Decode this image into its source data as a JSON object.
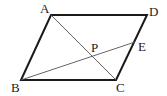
{
  "diagram": {
    "type": "geometry-parallelogram",
    "points": {
      "A": {
        "label": "A",
        "x": 51,
        "y": 15
      },
      "D": {
        "label": "D",
        "x": 147,
        "y": 15
      },
      "B": {
        "label": "B",
        "x": 21,
        "y": 80
      },
      "C": {
        "label": "C",
        "x": 116,
        "y": 80
      },
      "E": {
        "label": "E",
        "x": 135,
        "y": 42
      },
      "P": {
        "label": "P",
        "x": 91,
        "y": 56
      }
    },
    "edges": [
      {
        "from": "A",
        "to": "D",
        "style": "thick"
      },
      {
        "from": "D",
        "to": "C",
        "style": "thick"
      },
      {
        "from": "C",
        "to": "B",
        "style": "thick"
      },
      {
        "from": "B",
        "to": "A",
        "style": "thick"
      },
      {
        "from": "A",
        "to": "C",
        "style": "thin"
      },
      {
        "from": "B",
        "to": "E",
        "style": "thin"
      }
    ],
    "colors": {
      "stroke": "#1a1a1a",
      "thin_stroke": "#555555",
      "label": "#222222"
    }
  }
}
